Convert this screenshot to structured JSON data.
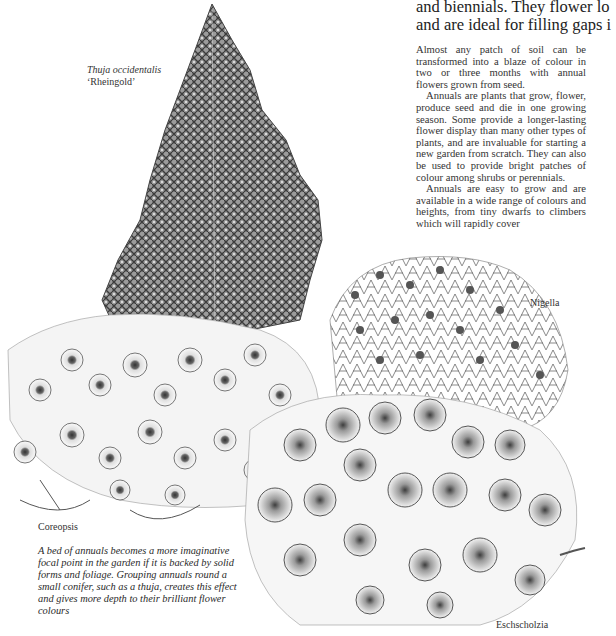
{
  "headline": {
    "lines": [
      "and biennials. They flower lo",
      "and are ideal for filling gaps i"
    ]
  },
  "body": {
    "paragraphs": [
      "Almost any patch of soil can be transformed into a blaze of colour in two or three months with annual flowers grown from seed.",
      "Annuals are plants that grow, flower, produce seed and die in one growing season. Some provide a longer-lasting flower display than many other types of plants, and are invaluable for starting a new garden from scratch. They can also be used to provide bright patches of colour among shrubs or perennials.",
      "Annuals are easy to grow and are available in a wide range of colours and heights, from tiny dwarfs to climbers which will rapidly cover"
    ]
  },
  "labels": {
    "thuja_latin": "Thuja occidentalis",
    "thuja_cultivar": "‘Rheingold’",
    "nigella": "Nigella",
    "coreopsis": "Coreopsis",
    "eschscholzia": "Eschscholzia"
  },
  "caption": "A bed of annuals becomes a more imaginative focal point in the garden if it is backed by solid forms and foliage. Grouping annuals round a small conifer, such as a thuja, creates this effect and gives more depth to their brilliant flower colours",
  "illustration": {
    "subject": "flower-bed-illustration",
    "colors": {
      "ink": "#3a3a3a",
      "shade": "#8a8a8a",
      "paper": "#ffffff"
    }
  }
}
